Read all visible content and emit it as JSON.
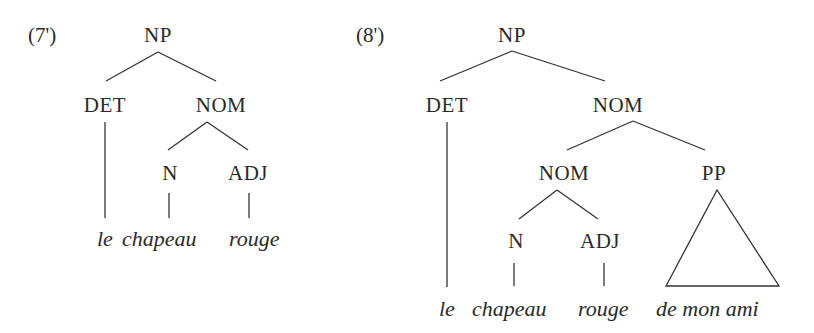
{
  "trees": [
    {
      "id": "7'",
      "label": "(7')",
      "nodes": {
        "np": "NP",
        "det": "DET",
        "nom": "NOM",
        "n": "N",
        "adj": "ADJ"
      },
      "words": [
        "le",
        "chapeau",
        "rouge"
      ]
    },
    {
      "id": "8'",
      "label": "(8')",
      "nodes": {
        "np": "NP",
        "det": "DET",
        "nom": "NOM",
        "nom_inner": "NOM",
        "pp": "PP",
        "n": "N",
        "adj": "ADJ"
      },
      "words": [
        "le",
        "chapeau",
        "rouge",
        "de mon ami"
      ]
    }
  ],
  "colors": {
    "ink": "#2a2a2a",
    "background": "#ffffff"
  }
}
